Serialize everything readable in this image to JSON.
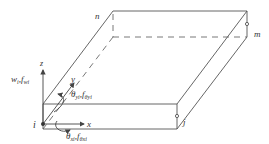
{
  "diagram": {
    "nodes": {
      "i": "i",
      "j": "j",
      "m": "m",
      "n": "n"
    },
    "axes": {
      "x": "x",
      "y": "y",
      "z": "z"
    },
    "dof_labels": {
      "w": "w",
      "w_sub": "i",
      "f_w": "f",
      "f_w_sub": "wi",
      "theta_y": "θ",
      "theta_y_sub": "yi",
      "f_theta_y": "f",
      "f_theta_y_sub": "θyi",
      "theta_x": "θ",
      "theta_x_sub": "xi",
      "f_theta_x": "f",
      "f_theta_x_sub": "θxi",
      "separator": ","
    },
    "colors": {
      "line": "#555555",
      "text": "#333333",
      "background": "#ffffff"
    }
  }
}
